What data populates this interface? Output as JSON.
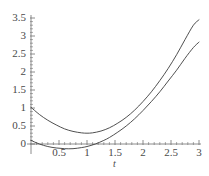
{
  "chart_data": {
    "type": "line",
    "title": "",
    "xlabel": "t",
    "ylabel": "",
    "xlim": [
      0,
      3
    ],
    "ylim": [
      -0.25,
      3.5
    ],
    "grid": false,
    "legend": false,
    "xticks": [
      "0.5",
      "1",
      "1.5",
      "2",
      "2.5",
      "3"
    ],
    "xtick_values": [
      0.5,
      1,
      1.5,
      2,
      2.5,
      3
    ],
    "yticks": [
      "0",
      "0.5",
      "1",
      "1.5",
      "2",
      "2.5",
      "3",
      "3.5"
    ],
    "ytick_values": [
      0,
      0.5,
      1,
      1.5,
      2,
      2.5,
      3,
      3.5
    ],
    "series": [
      {
        "name": "upper-curve",
        "color": "#3c3c3c",
        "x": [
          0,
          0.15,
          0.3,
          0.45,
          0.6,
          0.75,
          0.9,
          1.0,
          1.1,
          1.25,
          1.4,
          1.55,
          1.7,
          1.85,
          2.0,
          2.15,
          2.3,
          2.45,
          2.6,
          2.75,
          2.9,
          3.0
        ],
        "y": [
          1.02,
          0.82,
          0.66,
          0.53,
          0.42,
          0.35,
          0.31,
          0.3,
          0.31,
          0.36,
          0.45,
          0.58,
          0.74,
          0.94,
          1.18,
          1.45,
          1.76,
          2.1,
          2.48,
          2.9,
          3.3,
          3.45
        ]
      },
      {
        "name": "lower-curve",
        "color": "#3c3c3c",
        "x": [
          0,
          0.15,
          0.3,
          0.45,
          0.6,
          0.75,
          0.9,
          1.0,
          1.15,
          1.3,
          1.4,
          1.55,
          1.7,
          1.85,
          2.0,
          2.15,
          2.3,
          2.45,
          2.6,
          2.75,
          2.9,
          3.0
        ],
        "y": [
          0.1,
          0.0,
          -0.07,
          -0.11,
          -0.13,
          -0.13,
          -0.1,
          -0.07,
          0.0,
          0.1,
          0.18,
          0.33,
          0.5,
          0.7,
          0.93,
          1.18,
          1.45,
          1.75,
          2.05,
          2.38,
          2.68,
          2.83
        ]
      }
    ],
    "axis_color": "#6e6e6e",
    "tick_label_color": "#4a4a4a"
  },
  "geometry": {
    "origin_x": 31,
    "origin_y": 144,
    "x_scale_px_per_unit": 56,
    "y_scale_px_per_unit": 36,
    "x_axis_end": 201,
    "y_axis_top": 15
  }
}
